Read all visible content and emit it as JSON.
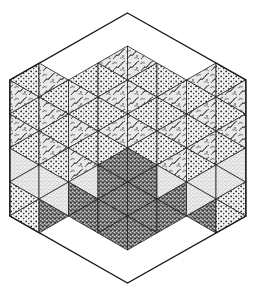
{
  "figure": {
    "width": 255,
    "height": 296,
    "center": [
      127.5,
      148
    ],
    "column_width": 29.5,
    "row_step": 34,
    "columns": 8,
    "hexagon": {
      "top": [
        127.5,
        13
      ],
      "upper_right": [
        246,
        80
      ],
      "lower_right": [
        246,
        216
      ],
      "bottom": [
        127.5,
        283
      ],
      "lower_left": [
        10,
        216
      ],
      "upper_left": [
        10,
        80
      ]
    },
    "colors": {
      "background": "#ffffff",
      "ink": "#1a1a1a",
      "line": "#222222"
    },
    "textures": {
      "L": {
        "name": "leafy",
        "base": "#e6e6e6"
      },
      "D": {
        "name": "dotted",
        "base": "#f4f4f4"
      },
      "S": {
        "name": "dark-stipple",
        "base": "#9a9a9a"
      },
      "G": {
        "name": "light-stipple",
        "base": "#e2e2e2"
      }
    },
    "regions_note": "Top half mixes leafy and dotted triangles; bottom-center rhombus dark stipple; lower-left and lower-right light stipple and dotted",
    "cells": [
      "col0: D,L,D,L,D,G,G,D",
      "col1: L,D,L,D,L,D,G,G,S",
      "col2: D,L,D,L,D,L,G,S,S,S",
      "col3: L,D,L,D,L,D,S,S,S,S,S",
      "col4: L,D,L,D,L,D,S,S,S,S,S",
      "col5: D,L,D,L,D,L,G,S,S,S",
      "col6: L,D,L,D,L,D,G,G,S",
      "col7: D,L,D,L,D,G,G,D"
    ]
  }
}
